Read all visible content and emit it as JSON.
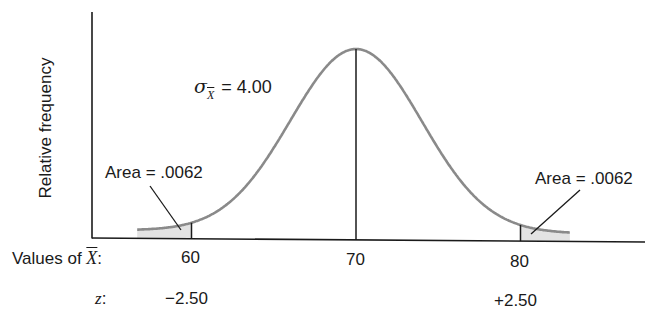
{
  "chart_data": {
    "type": "line",
    "title": "",
    "xlabel": "Values of X̄",
    "ylabel": "Relative frequency",
    "mean": 70,
    "sigma_xbar": 4.0,
    "x_ticks": [
      60,
      70,
      80
    ],
    "x_tick_labels": [
      "60",
      "70",
      "80"
    ],
    "z_values": [
      "−2.50",
      "",
      "+2.50"
    ],
    "annotations": [
      {
        "text": "σX̄ = 4.00",
        "position": "left of peak"
      },
      {
        "text": "Area = .0062",
        "region": "left tail, X̄ < 60"
      },
      {
        "text": "Area = .0062",
        "region": "right tail, X̄ > 80"
      }
    ],
    "shaded_regions": [
      {
        "from": 56.7,
        "to": 60,
        "area": 0.0062
      },
      {
        "from": 80,
        "to": 83.0,
        "area": 0.0062
      }
    ],
    "grid": false,
    "legend": null
  },
  "labels": {
    "y_axis": "Relative frequency",
    "sigma_symbol": "σ",
    "sigma_sub": "X",
    "sigma_value": " = 4.00",
    "area_left": "Area = .0062",
    "area_right": "Area = .0062",
    "values_prefix": "Values of ",
    "values_var": "X",
    "values_suffix": ":",
    "z_label": "z",
    "z_suffix": ":",
    "tick_60": "60",
    "tick_70": "70",
    "tick_80": "80",
    "z_left": "−2.50",
    "z_right": "+2.50"
  },
  "colors": {
    "curve": "#8a8a8a",
    "axis": "#1a1a1a",
    "shade": "#e3e3e3"
  }
}
